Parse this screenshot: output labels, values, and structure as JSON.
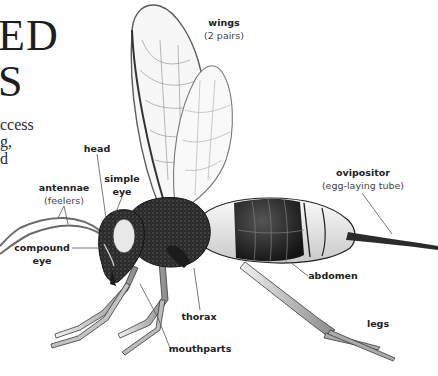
{
  "page": {
    "title_fragments": [
      "ED",
      "S"
    ],
    "body_fragments": [
      "ccess",
      "g,",
      "d"
    ]
  },
  "diagram": {
    "labels": {
      "wings": {
        "name": "wings",
        "note": "(2 pairs)"
      },
      "head": {
        "name": "head"
      },
      "simple_eye": {
        "name": "simple",
        "name2": "eye"
      },
      "antennae": {
        "name": "antennae",
        "note": "(feelers)"
      },
      "compound_eye": {
        "name": "compound",
        "name2": "eye"
      },
      "ovipositor": {
        "name": "ovipositor",
        "note": "(egg-laying tube)"
      },
      "abdomen": {
        "name": "abdomen"
      },
      "thorax": {
        "name": "thorax"
      },
      "legs": {
        "name": "legs"
      },
      "mouthparts": {
        "name": "mouthparts"
      }
    },
    "colors": {
      "ink": "#1a1a1a",
      "body_dark": "#262626",
      "body_light": "#e6e6e6",
      "wing": "#f7f7f7",
      "wing_vein": "#9a9a9a",
      "leader_line": "#555555"
    }
  }
}
